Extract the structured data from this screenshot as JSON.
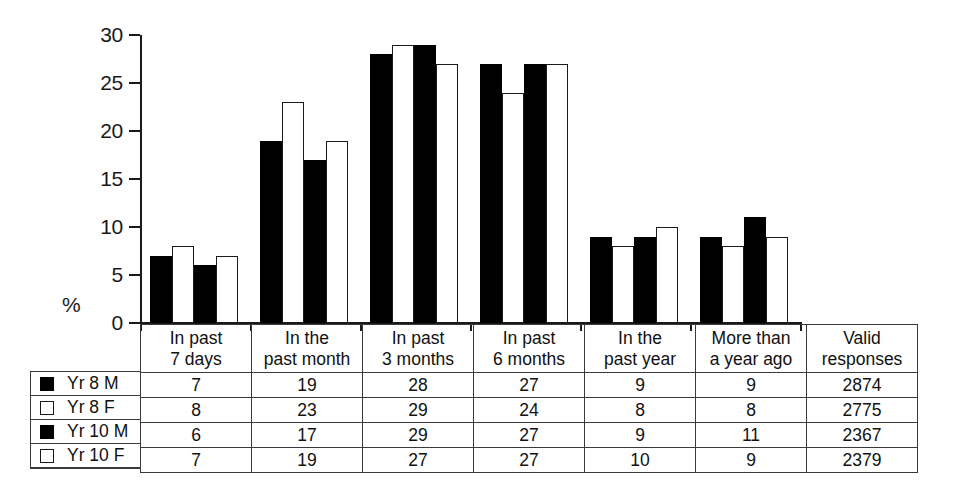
{
  "chart_data": {
    "type": "bar",
    "title": "",
    "xlabel": "",
    "ylabel": "%",
    "ylim": [
      0,
      30
    ],
    "ytick_values": [
      0,
      5,
      10,
      15,
      20,
      25,
      30
    ],
    "ytick_labels": [
      "0",
      "5",
      "10",
      "15",
      "20",
      "25",
      "30"
    ],
    "grid": false,
    "legend_position": "table-left",
    "categories": [
      "In past 7 days",
      "In the past month",
      "In past 3 months",
      "In past 6 months",
      "In the past year",
      "More than a year ago"
    ],
    "series": [
      {
        "name": "Yr 8 M",
        "fill": "black",
        "values": [
          7,
          19,
          28,
          27,
          9,
          9
        ]
      },
      {
        "name": "Yr 8 F",
        "fill": "white",
        "values": [
          8,
          23,
          29,
          24,
          8,
          8
        ]
      },
      {
        "name": "Yr 10 M",
        "fill": "black",
        "values": [
          6,
          17,
          29,
          27,
          9,
          11
        ]
      },
      {
        "name": "Yr 10 F",
        "fill": "white",
        "values": [
          7,
          19,
          27,
          27,
          10,
          9
        ]
      }
    ]
  },
  "axis": {
    "percent_label": "%",
    "ticks": [
      "30",
      "25",
      "20",
      "15",
      "10",
      "5",
      "0"
    ]
  },
  "table": {
    "column_headers": [
      {
        "line1": "In past",
        "line2": "7 days"
      },
      {
        "line1": "In the",
        "line2": "past month"
      },
      {
        "line1": "In past",
        "line2": "3 months"
      },
      {
        "line1": "In past",
        "line2": "6 months"
      },
      {
        "line1": "In the",
        "line2": "past year"
      },
      {
        "line1": "More than",
        "line2": "a year ago"
      },
      {
        "line1": "Valid",
        "line2": "responses"
      }
    ],
    "rows": [
      {
        "legend": "Yr 8 M",
        "swatch": "filled-square",
        "cells": [
          "7",
          "19",
          "28",
          "27",
          "9",
          "9",
          "2874"
        ]
      },
      {
        "legend": "Yr 8 F",
        "swatch": "open-square",
        "cells": [
          "8",
          "23",
          "29",
          "24",
          "8",
          "8",
          "2775"
        ]
      },
      {
        "legend": "Yr 10 M",
        "swatch": "filled-square",
        "cells": [
          "6",
          "17",
          "29",
          "27",
          "9",
          "11",
          "2367"
        ]
      },
      {
        "legend": "Yr 10 F",
        "swatch": "open-square",
        "cells": [
          "7",
          "19",
          "27",
          "27",
          "10",
          "9",
          "2379"
        ]
      }
    ]
  },
  "colors": {
    "male_fill": "#000000",
    "female_fill": "#ffffff",
    "outline": "#1a1a1a",
    "background": "#ffffff"
  }
}
